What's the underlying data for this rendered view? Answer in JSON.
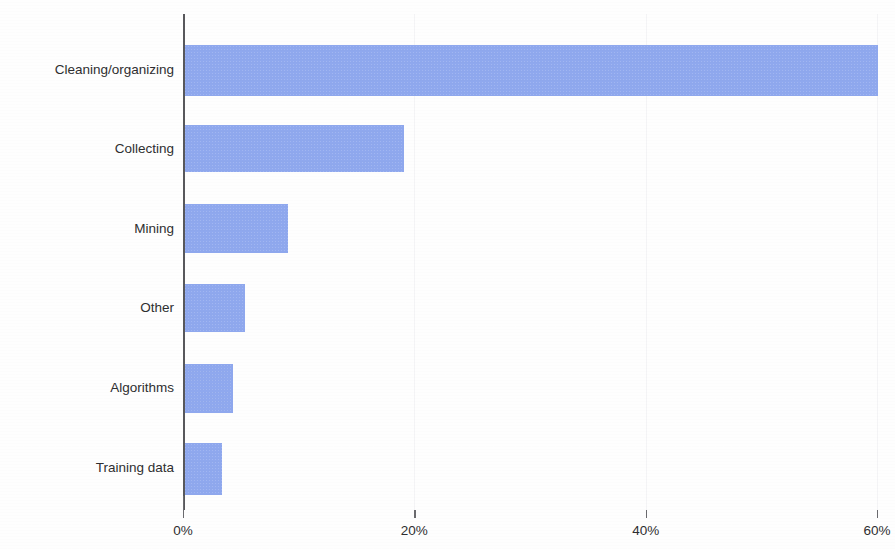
{
  "chart_data": {
    "type": "bar",
    "orientation": "horizontal",
    "title": "",
    "subtitle": "",
    "xlabel": "",
    "ylabel": "",
    "categories": [
      "Cleaning/organizing",
      "Collecting",
      "Mining",
      "Other",
      "Algorithms",
      "Training data"
    ],
    "values": [
      60,
      19,
      9,
      5.3,
      4.2,
      3.3
    ],
    "value_unit": "%",
    "xlim": [
      0,
      60
    ],
    "xticks": [
      0,
      20,
      40,
      60
    ],
    "xtick_labels": [
      "0%",
      "20%",
      "40%",
      "60%"
    ],
    "grid": "faint-vertical",
    "legend": "none",
    "series": [
      {
        "name": "Share of time",
        "values": [
          60,
          19,
          9,
          5.3,
          4.2,
          3.3
        ],
        "color": "#8fa8ee"
      }
    ],
    "annotations": []
  },
  "style": {
    "bar_color": "#8fa8ee",
    "axis_color": "#58585c",
    "text_color": "#2e2e30",
    "gridline_color": "#f4f4f6",
    "background": "#fefefe"
  }
}
